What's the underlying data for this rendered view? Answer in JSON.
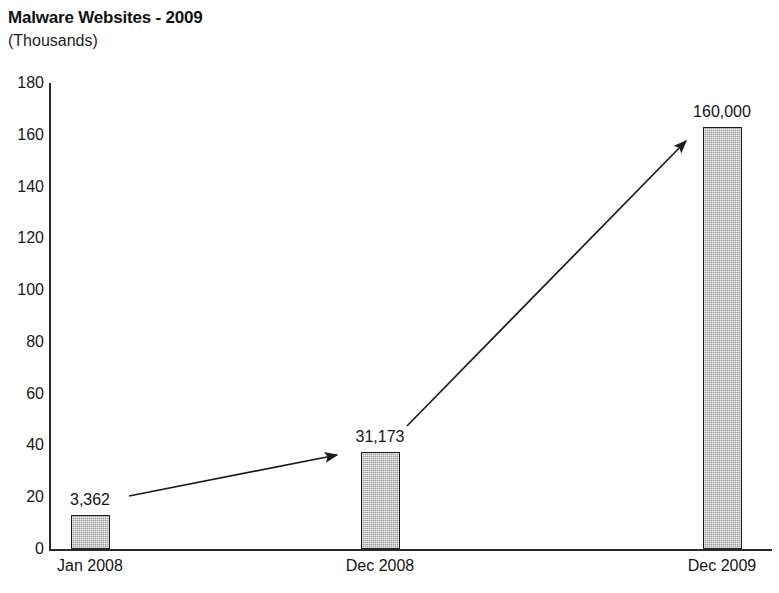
{
  "chart_data": {
    "type": "bar",
    "title": "Malware Websites - 2009",
    "subtitle": "(Thousands)",
    "xlabel": "",
    "ylabel": "",
    "categories": [
      "Jan 2008",
      "Dec 2008",
      "Dec 2009"
    ],
    "values": [
      13,
      37.5,
      163
    ],
    "data_labels": [
      "3,362",
      "31,173",
      "160,000"
    ],
    "ylim": [
      0,
      180
    ],
    "yticks": [
      0,
      20,
      40,
      60,
      80,
      100,
      120,
      140,
      160,
      180
    ],
    "ytick_labels": [
      "0",
      "20",
      "40",
      "60",
      "80",
      "100",
      "120",
      "140",
      "160",
      "180"
    ],
    "grid": false,
    "legend": false,
    "bar_fill_color": "#9a9a9a",
    "bar_border_color": "#1b1b1b",
    "axis_color": "#2a2a2a",
    "text_color": "#141414",
    "annotations": [
      {
        "name": "growth-arrow-1",
        "from_category": "Jan 2008",
        "to_category": "Dec 2008",
        "description": "upward trend arrow from Jan 2008 bar to Dec 2008 bar"
      },
      {
        "name": "growth-arrow-2",
        "from_category": "Dec 2008",
        "to_category": "Dec 2009",
        "description": "steep upward trend arrow from Dec 2008 bar to Dec 2009 bar"
      }
    ]
  }
}
